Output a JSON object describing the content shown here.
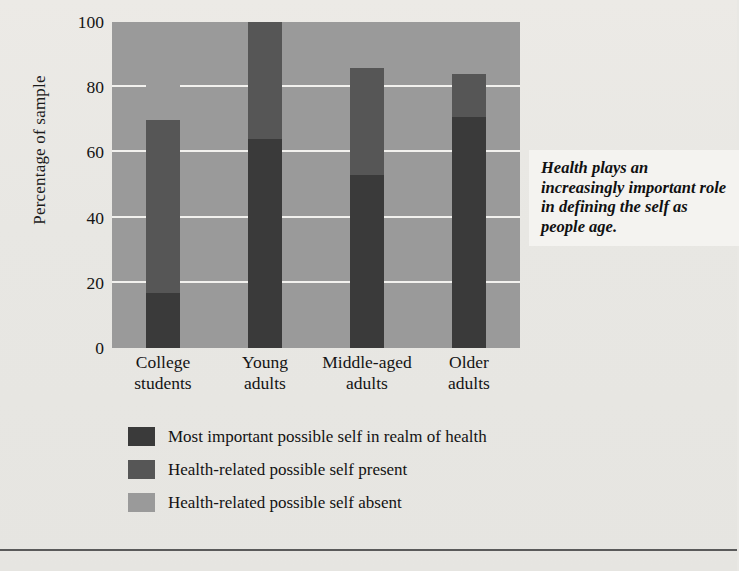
{
  "chart_data": {
    "type": "bar",
    "subtype": "stacked-bar-100",
    "title": "",
    "xlabel": "",
    "ylabel": "Percentage of sample",
    "ylim": [
      0,
      100
    ],
    "yticks": [
      0,
      20,
      40,
      60,
      80,
      100
    ],
    "grid": true,
    "legend_position": "bottom",
    "categories": [
      "College students",
      "Young adults",
      "Middle-aged adults",
      "Older adults"
    ],
    "category_lines": [
      [
        "College",
        "students"
      ],
      [
        "Young",
        "adults"
      ],
      [
        "Middle-aged",
        "adults"
      ],
      [
        "Older",
        "adults"
      ]
    ],
    "series": [
      {
        "name": "Most important possible self in realm of health",
        "color": "#3a3a3a",
        "values": [
          17,
          64,
          53,
          71
        ]
      },
      {
        "name": "Health-related possible self present",
        "color": "#565656",
        "values": [
          53,
          36,
          33,
          13
        ]
      },
      {
        "name": "Health-related possible self absent",
        "color": "#9a9a9a",
        "values": [
          30,
          0,
          14,
          16
        ]
      }
    ],
    "cumulative_tops": [
      [
        17,
        70,
        100
      ],
      [
        64,
        100,
        100
      ],
      [
        53,
        86,
        100
      ],
      [
        71,
        84,
        100
      ]
    ],
    "annotations": [
      {
        "name": "callout",
        "text": "Health plays an increasingly important role in defining the self as people age.",
        "lines": [
          "Health plays an",
          "increasingly",
          "important role in",
          "defining the self",
          "as people age."
        ]
      }
    ]
  },
  "axis": {
    "y_title": "Percentage of sample",
    "y_ticks": [
      "100",
      "80",
      "60",
      "40",
      "20",
      "0"
    ]
  },
  "legend": {
    "items": [
      {
        "label": "Most important possible self in realm of health",
        "color": "#3a3a3a"
      },
      {
        "label": "Health-related possible self present",
        "color": "#565656"
      },
      {
        "label": "Health-related possible self absent",
        "color": "#9a9a9a"
      }
    ]
  },
  "callout": {
    "line1": "Health plays an",
    "line2": "increasingly",
    "line3": "important role in",
    "line4": "defining the self",
    "line5": "as people age."
  },
  "colors": {
    "plot_background": "#9a9a9a",
    "gridline": "#f2f1ee",
    "page_background": "#e9e8e4",
    "segment_dark": "#3a3a3a",
    "segment_medium": "#565656",
    "segment_light": "#9a9a9a",
    "text": "#141414"
  }
}
